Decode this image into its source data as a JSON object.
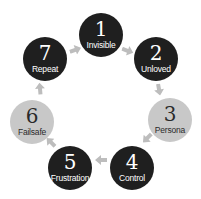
{
  "colors": {
    "dark": "#1f1f1f",
    "light": "#c8c8c8",
    "dark_text": "#ffffff",
    "light_text": "#2a2a2a",
    "arrow": "#bdbdbd"
  },
  "nodes": [
    {
      "num": "1",
      "label": "Invisible",
      "style": "dark",
      "cx": 101,
      "cy": 35,
      "r": 22
    },
    {
      "num": "2",
      "label": "Unloved",
      "style": "dark",
      "cx": 156,
      "cy": 59,
      "r": 22
    },
    {
      "num": "3",
      "label": "Persona",
      "style": "light",
      "cx": 170,
      "cy": 120,
      "r": 22
    },
    {
      "num": "4",
      "label": "Control",
      "style": "dark",
      "cx": 132,
      "cy": 168,
      "r": 22
    },
    {
      "num": "5",
      "label": "Frustration",
      "style": "dark",
      "cx": 70,
      "cy": 168,
      "r": 22
    },
    {
      "num": "6",
      "label": "Failsafe",
      "style": "light",
      "cx": 32,
      "cy": 122,
      "r": 22
    },
    {
      "num": "7",
      "label": "Repeat",
      "style": "dark",
      "cx": 45,
      "cy": 59,
      "r": 22
    }
  ],
  "arrows": [
    {
      "from": "7",
      "to": "1",
      "x": 74,
      "y": 46,
      "angle": -20
    },
    {
      "from": "1",
      "to": "2",
      "x": 129,
      "y": 47,
      "angle": 20
    },
    {
      "from": "2",
      "to": "3",
      "x": 163,
      "y": 89,
      "angle": 80
    },
    {
      "from": "3",
      "to": "4",
      "x": 150,
      "y": 141,
      "angle": 135
    },
    {
      "from": "4",
      "to": "5",
      "x": 101,
      "y": 164,
      "angle": 180
    },
    {
      "from": "5",
      "to": "6",
      "x": 48,
      "y": 145,
      "angle": -135
    },
    {
      "from": "6",
      "to": "7",
      "x": 36,
      "y": 89,
      "angle": -95
    }
  ]
}
